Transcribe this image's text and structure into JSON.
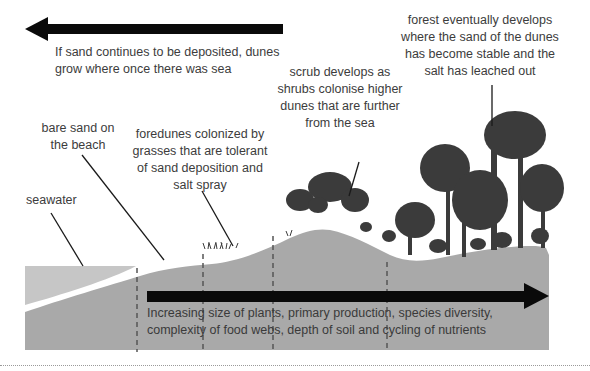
{
  "diagram": {
    "title_arrow": {
      "direction": "left",
      "text": "If sand continues to be deposited, dunes\ngrow where once there was sea"
    },
    "labels": {
      "seawater": "seawater",
      "bare_sand": "bare sand on\nthe beach",
      "foredunes": "foredunes colonized by\ngrasses that are tolerant\nof sand deposition and\nsalt spray",
      "scrub": "scrub develops as\nshrubs colonise higher\ndunes that are further\nfrom the sea",
      "forest": "forest eventually develops\nwhere the sand of the dunes\nhas become stable and the\nsalt has leached out"
    },
    "bottom_arrow": {
      "direction": "right",
      "text": "Increasing size of plants, primary production, species diversity,\ncomplexity of food webs, depth of soil and cycling of nutrients"
    },
    "zones": [
      "seawater",
      "bare sand",
      "foredunes",
      "scrub",
      "forest"
    ],
    "colors": {
      "ground": "#a9a9a9",
      "seawater": "#c4c4c4",
      "vegetation": "#3b3b3b",
      "arrow": "#0a0a0a",
      "text": "#3c3c3c"
    }
  }
}
